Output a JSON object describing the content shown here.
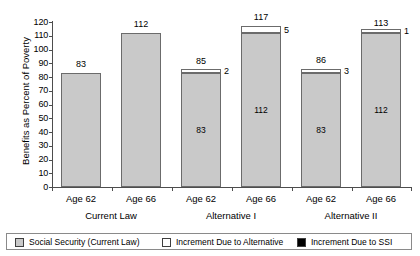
{
  "chart_data": {
    "type": "bar",
    "title": "",
    "subtitle": "",
    "xlabel": "",
    "ylabel": "Benefits as Percent of Poverty",
    "ylim": [
      0,
      120
    ],
    "yticks": [
      0,
      10,
      20,
      30,
      40,
      50,
      60,
      70,
      80,
      90,
      100,
      110,
      120
    ],
    "grid": false,
    "stacked": true,
    "legend_position": "bottom",
    "categories": [
      "Age 62",
      "Age 66",
      "Age 62",
      "Age 66",
      "Age 62",
      "Age 66"
    ],
    "groups": [
      "Current Law",
      "Alternative I",
      "Alternative II"
    ],
    "series": [
      {
        "name": "Social Security (Current Law)",
        "color": "#c9c9c9",
        "values": [
          83,
          112,
          83,
          112,
          83,
          112
        ]
      },
      {
        "name": "Increment Due to Alternative",
        "color": "#ffffff",
        "values": [
          0,
          0,
          2,
          5,
          3,
          1
        ]
      },
      {
        "name": "Increment Due to SSI",
        "color": "#000000",
        "values": [
          0,
          0,
          0,
          0,
          0,
          0
        ]
      }
    ],
    "totals": [
      83,
      112,
      85,
      117,
      86,
      113
    ],
    "bars": [
      {
        "group": "Current Law",
        "category": "Age 62",
        "total": 83,
        "total_label": "83",
        "base": 83,
        "base_label": "",
        "increment": 0,
        "increment_label": ""
      },
      {
        "group": "Current Law",
        "category": "Age 66",
        "total": 112,
        "total_label": "112",
        "base": 112,
        "base_label": "",
        "increment": 0,
        "increment_label": ""
      },
      {
        "group": "Alternative I",
        "category": "Age 62",
        "total": 85,
        "total_label": "85",
        "base": 83,
        "base_label": "83",
        "increment": 2,
        "increment_label": "2"
      },
      {
        "group": "Alternative I",
        "category": "Age 66",
        "total": 117,
        "total_label": "117",
        "base": 112,
        "base_label": "112",
        "increment": 5,
        "increment_label": "5"
      },
      {
        "group": "Alternative II",
        "category": "Age 62",
        "total": 86,
        "total_label": "86",
        "base": 83,
        "base_label": "83",
        "increment": 3,
        "increment_label": "3"
      },
      {
        "group": "Alternative II",
        "category": "Age 66",
        "total": 113,
        "total_label": "113",
        "base": 112,
        "base_label": "112",
        "increment": 1,
        "increment_label": "1"
      }
    ]
  },
  "axis": {
    "y_title": "Benefits as Percent of Poverty",
    "y_tick_labels": [
      "120",
      "110",
      "100",
      "90",
      "80",
      "70",
      "60",
      "50",
      "40",
      "30",
      "20",
      "10",
      "0"
    ]
  },
  "x_axis": {
    "categories": [
      {
        "label": "Age 62"
      },
      {
        "label": "Age 66"
      },
      {
        "label": "Age 62"
      },
      {
        "label": "Age 66"
      },
      {
        "label": "Age 62"
      },
      {
        "label": "Age 66"
      }
    ],
    "groups": [
      {
        "label": "Current Law"
      },
      {
        "label": "Alternative I"
      },
      {
        "label": "Alternative II"
      }
    ]
  },
  "legend": {
    "items": [
      {
        "label": "Social Security (Current Law)",
        "swatch": "gray"
      },
      {
        "label": "Increment Due to Alternative",
        "swatch": "white"
      },
      {
        "label": "Increment Due to SSI",
        "swatch": "black"
      }
    ]
  }
}
